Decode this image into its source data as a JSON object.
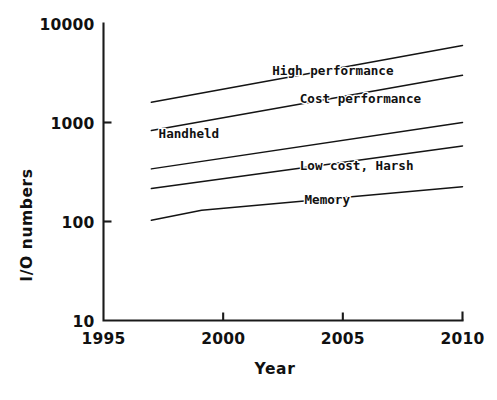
{
  "chart_data": {
    "type": "line",
    "title": "",
    "xlabel": "Year",
    "ylabel": "I/O numbers",
    "xlim": [
      1995,
      2010
    ],
    "ylim": [
      10,
      10000
    ],
    "yscale": "log",
    "grid": false,
    "legend": "inline-labels",
    "xticks": [
      "1995",
      "2000",
      "2005",
      "2010"
    ],
    "xtick_values": [
      1995,
      2000,
      2005,
      2010
    ],
    "yticks": [
      "10000",
      "1000",
      "100",
      "10"
    ],
    "ytick_values": [
      10000,
      1000,
      100,
      10
    ],
    "series": [
      {
        "name": "High performance",
        "label": "High performance",
        "label_x": 2002.05,
        "label_y": 3050,
        "x": [
          1997.0,
          2010.0
        ],
        "values": [
          1600,
          6000
        ]
      },
      {
        "name": "Cost performance",
        "label": "Cost performance",
        "label_x": 2003.2,
        "label_y": 1560,
        "x": [
          1997.0,
          2010.0
        ],
        "values": [
          830,
          3000
        ]
      },
      {
        "name": "Handheld",
        "label": "Handheld",
        "label_x": 1997.3,
        "label_y": 690,
        "x": [
          1997.0,
          2010.0
        ],
        "values": [
          340,
          1000
        ]
      },
      {
        "name": "Low cost, Harsh",
        "label": "Low cost, Harsh",
        "label_x": 2003.2,
        "label_y": 330,
        "x": [
          1997.0,
          2010.0
        ],
        "values": [
          215,
          580
        ]
      },
      {
        "name": "Memory",
        "label": "Memory",
        "label_x": 2003.4,
        "label_y": 152,
        "x": [
          1997.0,
          1999.1,
          2010.0
        ],
        "values": [
          103,
          130,
          225
        ]
      }
    ]
  },
  "axes": {
    "y_axis_title": "I/O numbers",
    "x_axis_title": "Year"
  }
}
